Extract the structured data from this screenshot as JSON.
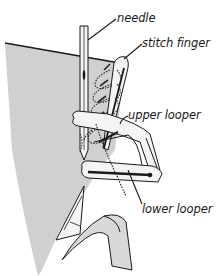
{
  "diagram": {
    "colors": {
      "fabric": "#d0d0d0",
      "outline": "#1a1a1a",
      "part_fill": "#f4f4f4",
      "thread": "#2a2a2a",
      "background": "#ffffff"
    },
    "labels": [
      {
        "id": "needle",
        "text": "needle",
        "x": 117,
        "y": 14
      },
      {
        "id": "stitch-finger",
        "text": "stitch finger",
        "x": 142,
        "y": 39
      },
      {
        "id": "upper-looper",
        "text": "upper looper",
        "x": 128,
        "y": 112
      },
      {
        "id": "lower-looper",
        "text": "lower looper",
        "x": 142,
        "y": 205
      }
    ]
  }
}
